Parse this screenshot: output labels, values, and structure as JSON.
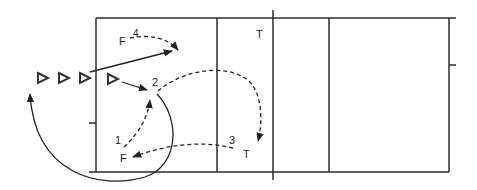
{
  "diagram": {
    "type": "volleyball drill court diagram",
    "colors": {
      "line": "#2b2b2b",
      "background": "#ffffff"
    },
    "players": [
      {
        "id": "f-top",
        "label": "F",
        "number": "4"
      },
      {
        "id": "t-top",
        "label": "T"
      },
      {
        "id": "setter",
        "number": "2"
      },
      {
        "id": "f-bottom",
        "label": "F",
        "number": "1"
      },
      {
        "id": "t-bottom",
        "label": "T",
        "number": "3"
      }
    ],
    "labels": {
      "f_top": "F",
      "num_4": "4",
      "t_top": "T",
      "num_2": "2",
      "num_1": "1",
      "f_bottom": "F",
      "num_3": "3",
      "t_bottom": "T"
    },
    "queue_markers": 4,
    "sequence": [
      {
        "step": "1",
        "from": "F (bottom)",
        "to": "2",
        "style": "dashed"
      },
      {
        "step": "2",
        "from": "2",
        "to": "T (bottom)",
        "style": "dashed"
      },
      {
        "step": "3",
        "from": "T (bottom)",
        "to": "F (bottom)",
        "style": "dashed"
      },
      {
        "step": "4",
        "from": "F (top)",
        "to": "attack zone",
        "style": "dashed"
      }
    ]
  }
}
